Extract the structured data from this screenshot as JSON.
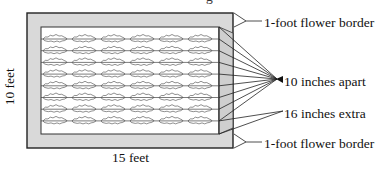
{
  "figure": {
    "title_fragment": "g",
    "dimensions": {
      "width_label": "15 feet",
      "height_label": "10 feet"
    },
    "annotations": {
      "top_border": "1-foot flower border",
      "spacing": "10 inches apart",
      "extra": "16 inches extra",
      "bottom_border": "1-foot flower border"
    },
    "planting_grid": {
      "rows": 8,
      "columns": 6
    },
    "colors": {
      "border_fill": "#d9d9d9",
      "strip_fill": "#cfcfcf",
      "bed_fill": "#ffffff",
      "stroke": "#222222"
    }
  }
}
